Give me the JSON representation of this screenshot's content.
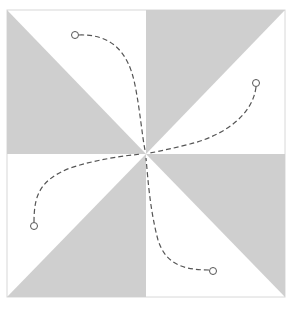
{
  "colors": {
    "background": "#ffffff",
    "shaded": "#cfcfcf",
    "border": "#d8d8d8",
    "stitch": "#555555"
  },
  "block": {
    "x": 7,
    "y": 10,
    "size": 278,
    "center": [
      146,
      154
    ]
  },
  "quadrants": [
    {
      "name": "top-left",
      "shaded_half": "lower-left"
    },
    {
      "name": "top-right",
      "shaded_half": "upper-left"
    },
    {
      "name": "bottom-left",
      "shaded_half": "lower-right"
    },
    {
      "name": "bottom-right",
      "shaded_half": "upper-right"
    }
  ],
  "stitch_paths": [
    {
      "name": "top-left",
      "start": [
        75,
        35
      ],
      "end": [
        146,
        150
      ]
    },
    {
      "name": "top-right",
      "start": [
        256,
        83
      ],
      "end": [
        150,
        154
      ]
    },
    {
      "name": "bottom-left",
      "start": [
        33,
        226
      ],
      "end": [
        142,
        154
      ]
    },
    {
      "name": "bottom-right",
      "start": [
        213,
        271
      ],
      "end": [
        146,
        158
      ]
    }
  ]
}
